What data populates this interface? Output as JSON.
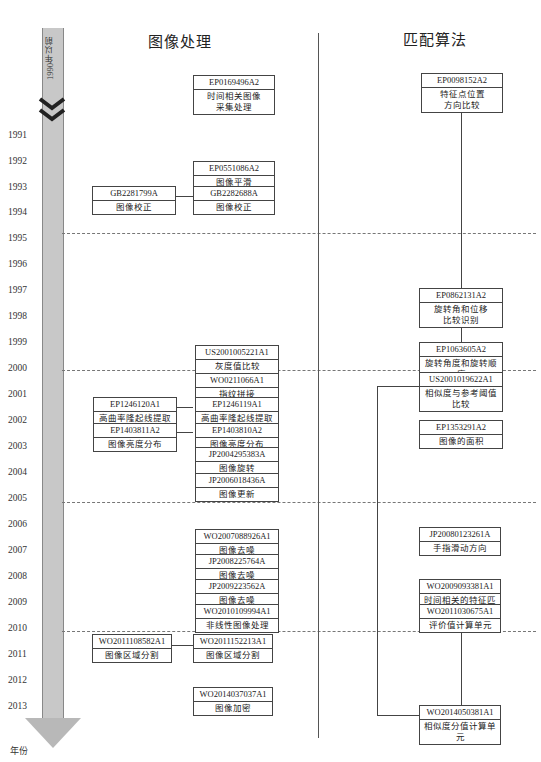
{
  "columns": {
    "left_title": "图像处理",
    "right_title": "匹配算法"
  },
  "timeline": {
    "pre_label": "1990年以前",
    "axis_label": "年份",
    "years": [
      "1991",
      "1992",
      "1993",
      "1994",
      "1995",
      "1996",
      "1997",
      "1998",
      "1999",
      "2000",
      "2001",
      "2002",
      "2003",
      "2004",
      "2005",
      "2006",
      "2007",
      "2008",
      "2009",
      "2010",
      "2011",
      "2012",
      "2013"
    ]
  },
  "image_processing": [
    {
      "id": "EP0169496A2",
      "desc": "时间相关图像\n采集处理"
    },
    {
      "id": "EP0551086A2",
      "desc": "图像平滑"
    },
    {
      "id": "GB2281799A",
      "desc": "图像校正"
    },
    {
      "id": "GB2282688A",
      "desc": "图像校正"
    },
    {
      "id": "US2001005221A1",
      "desc": "灰度值比较"
    },
    {
      "id": "WO0211066A1",
      "desc": "指纹拼接"
    },
    {
      "id": "EP1246120A1",
      "desc": "高曲率隆起线提取处理"
    },
    {
      "id": "EP1246119A1",
      "desc": "高曲率隆起线提取处理"
    },
    {
      "id": "EP1403811A2",
      "desc": "图像亮度分布"
    },
    {
      "id": "EP1403810A2",
      "desc": "图像亮度分布"
    },
    {
      "id": "JP2004295383A",
      "desc": "图像旋转"
    },
    {
      "id": "JP2006018436A",
      "desc": "图像更新"
    },
    {
      "id": "WO2007088926A1",
      "desc": "图像去噪"
    },
    {
      "id": "JP2008225764A",
      "desc": "图像去噪"
    },
    {
      "id": "JP2009223562A",
      "desc": "图像去噪"
    },
    {
      "id": "WO2010109994A1",
      "desc": "非线性图像处理"
    },
    {
      "id": "WO2011108582A1",
      "desc": "图像区域分割"
    },
    {
      "id": "WO2011152213A1",
      "desc": "图像区域分割"
    },
    {
      "id": "WO2014037037A1",
      "desc": "图像加密"
    }
  ],
  "matching": [
    {
      "id": "EP0098152A2",
      "desc": "特征点位置\n方向比较"
    },
    {
      "id": "EP0862131A2",
      "desc": "旋转角和位移\n比较识别"
    },
    {
      "id": "EP1063605A2",
      "desc": "旋转角度和旋转顺序"
    },
    {
      "id": "US2001019622A1",
      "desc": "相似度与参考阈值比较"
    },
    {
      "id": "EP1353291A2",
      "desc": "图像的面积"
    },
    {
      "id": "JP20080123261A",
      "desc": "手指滑动方向"
    },
    {
      "id": "WO2009093381A1",
      "desc": "时间相关的特征匹配"
    },
    {
      "id": "WO2011030675A1",
      "desc": "评价值计算单元"
    },
    {
      "id": "WO2014050381A1",
      "desc": "相似度分值计算单元"
    }
  ]
}
